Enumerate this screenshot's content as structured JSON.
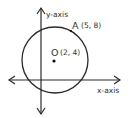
{
  "diagram": {
    "type": "coordinate-geometry",
    "axes": {
      "x_label": "x-axis",
      "y_label": "y-axis"
    },
    "circle": {
      "center_label": "O",
      "center_coords": "(2, 4)",
      "point_label": "A",
      "point_coords": "(5, 8)"
    },
    "colors": {
      "stroke": "#2a2a2a",
      "text": "#333333",
      "background": "#ffffff"
    }
  }
}
